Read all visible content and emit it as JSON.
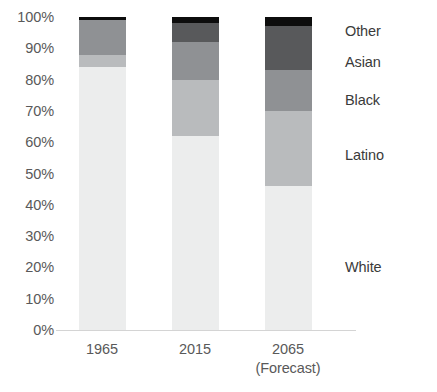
{
  "chart_data": {
    "type": "bar",
    "title": "",
    "subtitle": "",
    "xlabel": "",
    "ylabel": "",
    "stacked": true,
    "stack_mode": "percent",
    "grid": false,
    "legend_position": "right-aligned-to-segments",
    "ylim": [
      0,
      100
    ],
    "y_ticks": [
      "0%",
      "10%",
      "20%",
      "30%",
      "40%",
      "50%",
      "60%",
      "70%",
      "80%",
      "90%",
      "100%"
    ],
    "y_tick_values": [
      0,
      10,
      20,
      30,
      40,
      50,
      60,
      70,
      80,
      90,
      100
    ],
    "categories": [
      "1965",
      "2015",
      "2065"
    ],
    "category_sublabels": [
      "",
      "",
      "(Forecast)"
    ],
    "series": [
      {
        "name": "White",
        "color": "#eceded",
        "values": [
          84,
          62,
          46
        ]
      },
      {
        "name": "Latino",
        "color": "#b9bbbd",
        "values": [
          4,
          18,
          24
        ]
      },
      {
        "name": "Black",
        "color": "#8f9194",
        "values": [
          11,
          12,
          13
        ]
      },
      {
        "name": "Asian",
        "color": "#58595b",
        "values": [
          0,
          6,
          14
        ]
      },
      {
        "name": "Other",
        "color": "#0d0d0d",
        "values": [
          1,
          2,
          3
        ]
      }
    ],
    "legend_entries": [
      {
        "label": "Other",
        "value_pct_y": 98
      },
      {
        "label": "Asian",
        "value_pct_y": 90
      },
      {
        "label": "Black",
        "value_pct_y": 79
      },
      {
        "label": "Latino",
        "value_pct_y": 58
      },
      {
        "label": "White",
        "value_pct_y": 23
      }
    ]
  },
  "axis": {
    "tick_0": "0%",
    "tick_10": "10%",
    "tick_20": "20%",
    "tick_30": "30%",
    "tick_40": "40%",
    "tick_50": "50%",
    "tick_60": "60%",
    "tick_70": "70%",
    "tick_80": "80%",
    "tick_90": "90%",
    "tick_100": "100%"
  },
  "xaxis": {
    "cat_0": "1965",
    "cat_1": "2015",
    "cat_2": "2065",
    "cat_2_sub": "(Forecast)"
  },
  "legend": {
    "other": "Other",
    "asian": "Asian",
    "black": "Black",
    "latino": "Latino",
    "white": "White"
  }
}
